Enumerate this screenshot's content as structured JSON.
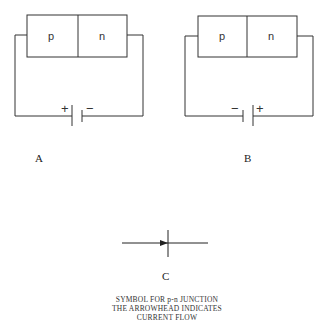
{
  "diagrams": [
    {
      "id": "A",
      "label": "A",
      "region_left": "p",
      "region_right": "n",
      "battery_left_sign": "+",
      "battery_right_sign": "−"
    },
    {
      "id": "B",
      "label": "B",
      "region_left": "p",
      "region_right": "n",
      "battery_left_sign": "−",
      "battery_right_sign": "+"
    }
  ],
  "symbol": {
    "label": "C",
    "caption_lines": [
      "SYMBOL FOR p-n JUNCTION",
      "THE ARROWHEAD INDICATES",
      "CURRENT FLOW"
    ]
  },
  "colors": {
    "line": "#333333",
    "background": "#ffffff"
  }
}
